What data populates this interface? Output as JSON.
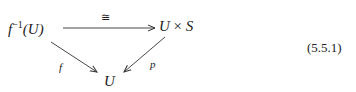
{
  "diagram": {
    "nodes": {
      "preimage": {
        "base": "f",
        "sup": "−1",
        "arg": "(U)"
      },
      "product": {
        "left": "U",
        "op": " × ",
        "right": "S"
      },
      "base": "U"
    },
    "arrows": {
      "top": {
        "label": "≅"
      },
      "left": {
        "label": "f"
      },
      "right": {
        "label": "p"
      }
    },
    "equation_number": "(5.5.1)"
  }
}
